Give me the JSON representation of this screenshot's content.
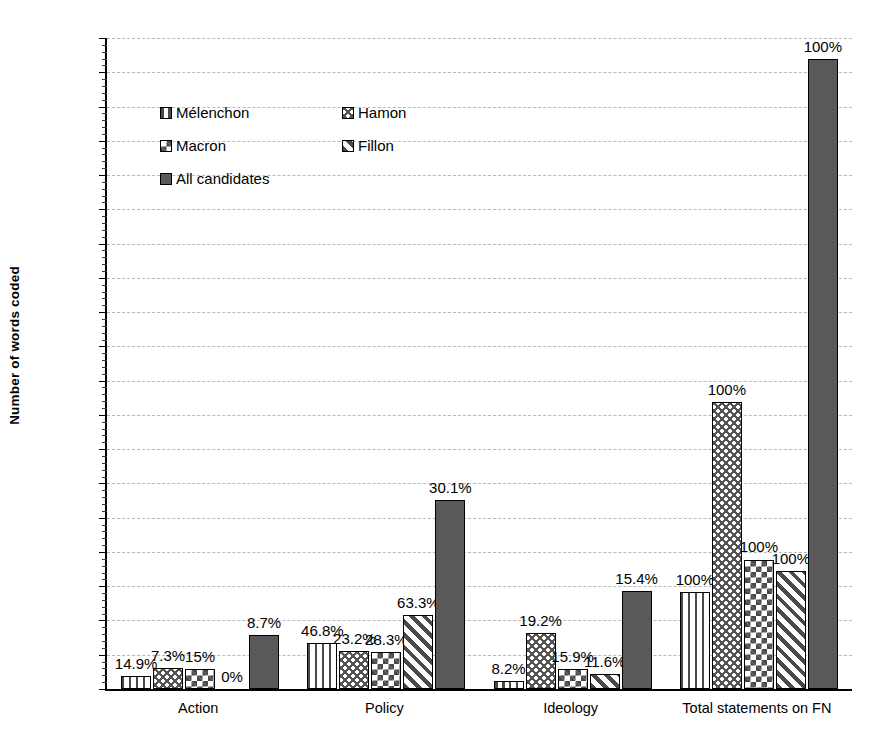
{
  "chart_data": {
    "type": "bar",
    "title": "",
    "xlabel": "",
    "ylabel": "Number of words coded",
    "ylim": [
      0,
      19000
    ],
    "ytick_step": 1000,
    "yticks": [
      "0",
      "1000",
      "2000",
      "3000",
      "4000",
      "5000",
      "6000",
      "7000",
      "8000",
      "9000",
      "10000",
      "11000",
      "12000",
      "13000",
      "14000",
      "15000",
      "16000",
      "17000",
      "18000",
      "19000"
    ],
    "grid": true,
    "legend_position": "upper-left-inside",
    "categories": [
      "Action",
      "Policy",
      "Ideology",
      "Total statements on FN"
    ],
    "series": [
      {
        "name": "Mélenchon",
        "pattern": "vertical-stripes",
        "values": [
          390,
          1340,
          230,
          2840
        ],
        "labels": [
          "14.9%",
          "46.8%",
          "8.2%",
          "100%"
        ]
      },
      {
        "name": "Hamon",
        "pattern": "wavy-zigzag",
        "values": [
          620,
          1100,
          1630,
          8370
        ],
        "labels": [
          "7.3%",
          "23.2%",
          "19.2%",
          "100%"
        ]
      },
      {
        "name": "Macron",
        "pattern": "checkerboard",
        "values": [
          570,
          1080,
          580,
          3780
        ],
        "labels": [
          "15%",
          "28.3%",
          "15.9%",
          "100%"
        ]
      },
      {
        "name": "Fillon",
        "pattern": "diagonal-stripes",
        "values": [
          0,
          2150,
          450,
          3450
        ],
        "labels": [
          "0%",
          "63.3%",
          "11.6%",
          "100%"
        ]
      },
      {
        "name": "All candidates",
        "pattern": "solid-gray",
        "values": [
          1590,
          5520,
          2860,
          18380
        ],
        "labels": [
          "8.7%",
          "30.1%",
          "15.4%",
          "100%"
        ]
      }
    ]
  },
  "legend": {
    "entries": [
      {
        "label": "Mélenchon",
        "pattern": "vertical-stripes"
      },
      {
        "label": "Hamon",
        "pattern": "wavy-zigzag"
      },
      {
        "label": "Macron",
        "pattern": "checkerboard"
      },
      {
        "label": "Fillon",
        "pattern": "diagonal-stripes"
      },
      {
        "label": "All candidates",
        "pattern": "solid-gray"
      }
    ]
  },
  "colors": {
    "axis": "#000000",
    "gridline": "#b9b9b9",
    "solid_bar": "#595959",
    "pattern_ink": "#4a4a4a",
    "background": "#ffffff"
  }
}
